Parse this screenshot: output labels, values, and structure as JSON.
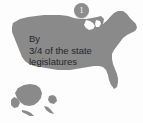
{
  "figure": {
    "badge": {
      "number": "1",
      "color": "#8d8d8d",
      "text_color": "#f4f4f4"
    },
    "caption": {
      "lines": [
        "By",
        "3/4 of the state",
        "legislatures"
      ],
      "full_text": "By 3/4 of the state legislatures",
      "color": "#262626"
    },
    "map": {
      "name": "united-states-map",
      "fill_color": "#8a8a8a",
      "background_color": "#fdfdfd",
      "regions": [
        "contiguous-united-states",
        "alaska",
        "hawaii"
      ]
    }
  }
}
